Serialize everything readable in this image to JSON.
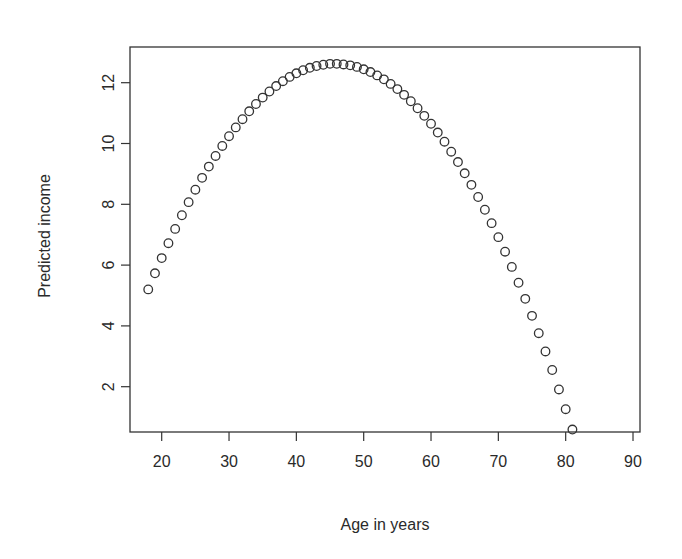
{
  "chart_data": {
    "type": "scatter",
    "title": "",
    "xlabel": "Age in years",
    "ylabel": "Predicted income",
    "xlim": [
      15.3,
      91.2
    ],
    "ylim": [
      0.5,
      13.2
    ],
    "x_ticks": [
      20,
      30,
      40,
      50,
      60,
      70,
      80,
      90
    ],
    "x_tick_labels": [
      "20",
      "30",
      "40",
      "50",
      "60",
      "70",
      "80",
      "90"
    ],
    "y_ticks": [
      2,
      4,
      6,
      8,
      10,
      12
    ],
    "y_tick_labels": [
      "2",
      "4",
      "6",
      "8",
      "10",
      "12"
    ],
    "grid": false,
    "legend": null,
    "marker": "open-circle",
    "marker_color": "#333333",
    "series": [
      {
        "name": "Predicted income",
        "x": [
          18,
          19,
          20,
          21,
          22,
          23,
          24,
          25,
          26,
          27,
          28,
          29,
          30,
          31,
          32,
          33,
          34,
          35,
          36,
          37,
          38,
          39,
          40,
          41,
          42,
          43,
          44,
          45,
          46,
          47,
          48,
          49,
          50,
          51,
          52,
          53,
          54,
          55,
          56,
          57,
          58,
          59,
          60,
          61,
          62,
          63,
          64,
          65,
          66,
          67,
          68,
          69,
          70,
          71,
          72,
          73,
          74,
          75,
          76,
          77,
          78,
          79,
          80,
          81
        ],
        "y": [
          5.2,
          5.73,
          6.23,
          6.72,
          7.19,
          7.64,
          8.07,
          8.48,
          8.87,
          9.24,
          9.59,
          9.92,
          10.24,
          10.53,
          10.8,
          11.06,
          11.3,
          11.51,
          11.71,
          11.89,
          12.05,
          12.19,
          12.31,
          12.41,
          12.49,
          12.55,
          12.59,
          12.62,
          12.62,
          12.6,
          12.57,
          12.52,
          12.44,
          12.35,
          12.24,
          12.11,
          11.96,
          11.79,
          11.6,
          11.39,
          11.16,
          10.91,
          10.65,
          10.36,
          10.06,
          9.73,
          9.39,
          9.02,
          8.64,
          8.24,
          7.82,
          7.38,
          6.92,
          6.44,
          5.94,
          5.42,
          4.89,
          4.33,
          3.76,
          3.16,
          2.55,
          1.91,
          1.26,
          0.59
        ]
      }
    ]
  },
  "layout": {
    "plot": {
      "left": 130,
      "right": 640,
      "top": 47,
      "bottom": 432
    },
    "x_px_at_20": 161.7,
    "x_px_per_unit": 6.733,
    "y_px_at_0": 447.5,
    "y_px_per_unit": 30.4
  }
}
